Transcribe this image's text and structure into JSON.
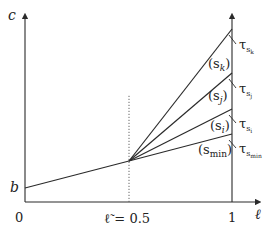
{
  "diagram": {
    "type": "piecewise-linear cost lines",
    "colors": {
      "line": "#2a2a2a",
      "dotted": "#555555",
      "text": "#222222"
    },
    "axes": {
      "y_label": "c",
      "x_label": "ℓ",
      "origin_label": "0",
      "x_end_label": "1",
      "y_intercept_label": "b",
      "x_mid_label": "ℓ̃ = 0.5"
    },
    "lines": [
      {
        "name": "s_k",
        "label": "(s",
        "sub": "k",
        "tau": "τ",
        "tau_sub": "s",
        "tau_subsub": "k"
      },
      {
        "name": "s_j",
        "label": "(s",
        "sub": "j",
        "tau": "τ",
        "tau_sub": "s",
        "tau_subsub": "j"
      },
      {
        "name": "s_i",
        "label": "(s",
        "sub": "i",
        "tau": "τ",
        "tau_sub": "s",
        "tau_subsub": "i"
      },
      {
        "name": "s_min",
        "label": "(s",
        "sub": "min",
        "tau": "τ",
        "tau_sub": "s",
        "tau_subsub": "min"
      }
    ],
    "close_paren": ")"
  }
}
